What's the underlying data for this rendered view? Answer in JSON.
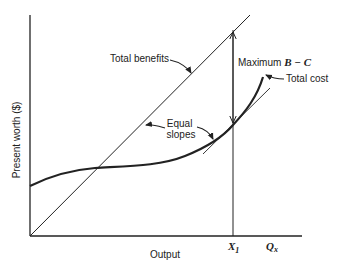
{
  "diagram": {
    "type": "economic-cost-benefit",
    "axes": {
      "y_label": "Present worth ($)",
      "x_label": "Output",
      "x_end_label": "Q",
      "x_end_label_sub": "x",
      "x_marker_label": "X",
      "x_marker_label_sub": "1"
    },
    "curves": {
      "benefits_label": "Total benefits",
      "cost_label": "Total cost"
    },
    "annotations": {
      "max_label": "Maximum ",
      "max_expr": "B − C",
      "equal_slopes_line1": "Equal",
      "equal_slopes_line2": "slopes"
    },
    "colors": {
      "ink": "#222222",
      "background": "#ffffff"
    }
  }
}
